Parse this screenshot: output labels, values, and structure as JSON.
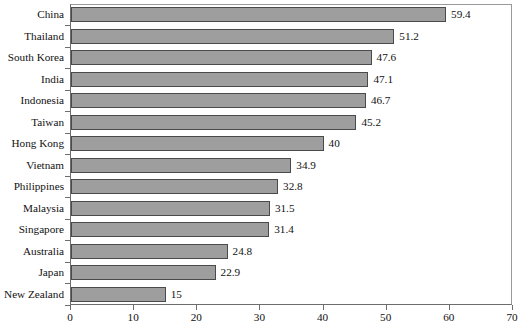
{
  "chart_data": {
    "type": "bar",
    "orientation": "horizontal",
    "title": "",
    "subtitle": "",
    "xlabel": "",
    "ylabel": "",
    "xlim": [
      0,
      70
    ],
    "xticks": [
      0,
      10,
      20,
      30,
      40,
      50,
      60,
      70
    ],
    "grid": false,
    "legend": false,
    "bar_fill_color": "#9e9e9e",
    "bar_border_color": "#4a4a4a",
    "axis_color": "#6d6d6d",
    "background_color": "#ffffff",
    "categories": [
      "China",
      "Thailand",
      "South Korea",
      "India",
      "Indonesia",
      "Taiwan",
      "Hong Kong",
      "Vietnam",
      "Philippines",
      "Malaysia",
      "Singapore",
      "Australia",
      "Japan",
      "New Zealand"
    ],
    "values": [
      59.4,
      51.2,
      47.6,
      47.1,
      46.7,
      45.2,
      40,
      34.9,
      32.8,
      31.5,
      31.4,
      24.8,
      22.9,
      15
    ],
    "value_labels": [
      "59.4",
      "51.2",
      "47.6",
      "47.1",
      "46.7",
      "45.2",
      "40",
      "34.9",
      "32.8",
      "31.5",
      "31.4",
      "24.8",
      "22.9",
      "15"
    ],
    "xtick_labels": [
      "0",
      "10",
      "20",
      "30",
      "40",
      "50",
      "60",
      "70"
    ]
  }
}
